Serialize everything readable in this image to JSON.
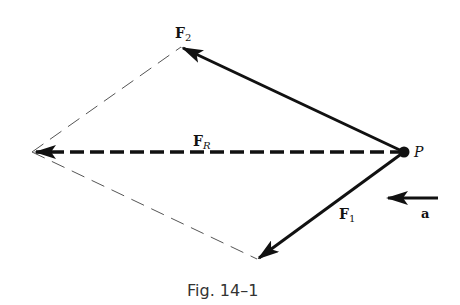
{
  "figure": {
    "caption": "Fig. 14–1",
    "point_label": "P",
    "vectors": [
      {
        "id": "F2",
        "label_main": "F",
        "label_sub": "2",
        "from": [
          404,
          152
        ],
        "to": [
          181,
          47
        ],
        "style": "solid"
      },
      {
        "id": "FR",
        "label_main": "F",
        "label_sub": "R",
        "from": [
          404,
          152
        ],
        "to": [
          32,
          152
        ],
        "style": "dashed"
      },
      {
        "id": "F1",
        "label_main": "F",
        "label_sub": "1",
        "from": [
          404,
          152
        ],
        "to": [
          257,
          259
        ],
        "style": "solid"
      },
      {
        "id": "a",
        "label_main": "a",
        "from": [
          438,
          198
        ],
        "to": [
          386,
          198
        ],
        "style": "solid"
      }
    ],
    "construction_lines": [
      {
        "from": [
          32,
          152
        ],
        "to": [
          181,
          47
        ],
        "style": "thin-dashed"
      },
      {
        "from": [
          32,
          152
        ],
        "to": [
          257,
          259
        ],
        "style": "thin-dashed"
      }
    ],
    "colors": {
      "ink": "#111111",
      "construction": "#555555",
      "caption": "#333333"
    }
  }
}
